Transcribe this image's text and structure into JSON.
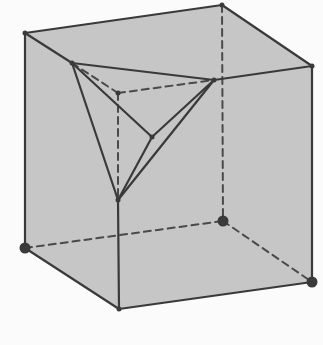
{
  "diagram": {
    "colors": {
      "background": "#fbfbfb",
      "face_fill": "#c6c6c6",
      "edge": "#3a3a3a",
      "hidden_edge": "#4a4a4a",
      "vertex": "#3a3a3a"
    },
    "vertices": {
      "top_left": [
        25,
        33
      ],
      "top_back": [
        222,
        5
      ],
      "top_right": [
        312,
        66
      ],
      "bottom_left": [
        25,
        248
      ],
      "bottom_front": [
        119,
        309
      ],
      "bottom_right": [
        312,
        282
      ],
      "bottom_back_hidden": [
        223,
        221
      ],
      "top_front_hidden": [
        118,
        93
      ],
      "cut_left": [
        72,
        63
      ],
      "cut_right": [
        214,
        80
      ],
      "cut_bottom": [
        118,
        200
      ],
      "cut_inner": [
        152,
        137
      ]
    },
    "large_vertex_markers": [
      "bottom_left",
      "bottom_back_hidden",
      "bottom_right"
    ]
  }
}
